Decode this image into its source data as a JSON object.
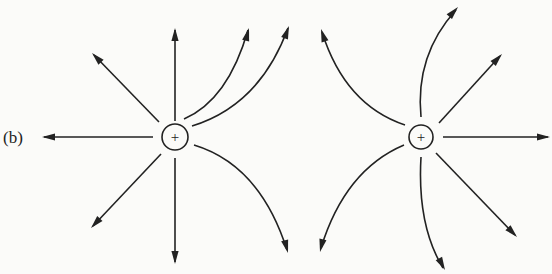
{
  "figure": {
    "panel_label": "(b)",
    "colors": {
      "line": "#222222",
      "background": "#fbfbf9"
    }
  },
  "charges": [
    {
      "id": "left",
      "sign": "+",
      "cx": 175,
      "cy": 137,
      "r": 13
    },
    {
      "id": "right",
      "sign": "+",
      "cx": 421,
      "cy": 137,
      "r": 12
    }
  ],
  "field_lines": [
    {
      "charge": "left",
      "d": "M175 121 L175 30",
      "arrow": [
        175,
        28,
        -90
      ]
    },
    {
      "charge": "left",
      "d": "M159 122 L94 55",
      "arrow": [
        92,
        53,
        -134
      ]
    },
    {
      "charge": "left",
      "d": "M153 137 L44 137",
      "arrow": [
        42,
        137,
        180
      ]
    },
    {
      "charge": "left",
      "d": "M161 154 L93 226",
      "arrow": [
        91,
        228,
        133
      ]
    },
    {
      "charge": "left",
      "d": "M175 158 L175 262",
      "arrow": [
        175,
        264,
        90
      ]
    },
    {
      "charge": "left",
      "d": "M184 119 Q228 100 248 30",
      "arrow": [
        249,
        28,
        -75
      ]
    },
    {
      "charge": "left",
      "d": "M192 126 Q260 105 288 28",
      "arrow": [
        289,
        26,
        -70
      ]
    },
    {
      "charge": "left",
      "d": "M194 145 Q260 165 287 250",
      "arrow": [
        288,
        253,
        75
      ]
    },
    {
      "charge": "right",
      "d": "M405 125 Q345 105 322 32",
      "arrow": [
        321,
        29,
        -108
      ]
    },
    {
      "charge": "right",
      "d": "M404 145 Q345 170 321 248",
      "arrow": [
        320,
        252,
        103
      ]
    },
    {
      "charge": "right",
      "d": "M421 117 Q415 55 456 10",
      "arrow": [
        458,
        7,
        -48
      ]
    },
    {
      "charge": "right",
      "d": "M439 123 L500 56",
      "arrow": [
        502,
        54,
        -47
      ]
    },
    {
      "charge": "right",
      "d": "M443 137 L548 137",
      "arrow": [
        550,
        137,
        0
      ]
    },
    {
      "charge": "right",
      "d": "M436 153 L515 235",
      "arrow": [
        517,
        237,
        46
      ]
    },
    {
      "charge": "right",
      "d": "M421 157 Q417 225 443 268",
      "arrow": [
        445,
        270,
        62
      ]
    }
  ]
}
